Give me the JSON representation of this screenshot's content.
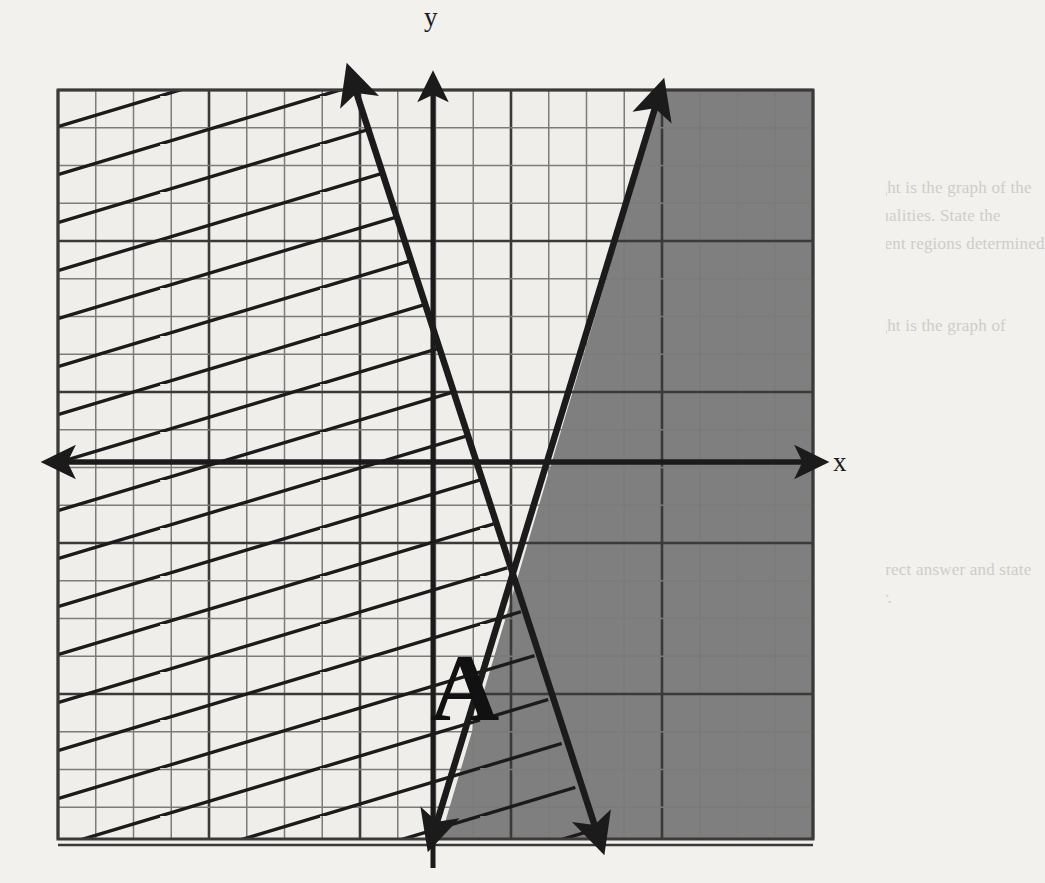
{
  "page": {
    "width": 886,
    "height": 883,
    "background_color": "#f2f1ee",
    "ink_color": "#1b1b1b"
  },
  "bleed_text": {
    "note": "faint mirrored text bleeding through from the reverse side of the scanned page",
    "lines": [
      {
        "text": "e are counted in this part. A correct answer will receive 4 points. Like",
        "x": 12,
        "y": 6,
        "mirrored": false
      },
      {
        "text": "ur the necessary steps, including appropriate formula substitutions,",
        "x": 14,
        "y": 30,
        "mirrored": false
      },
      {
        "text": "ams, graphs, charts, etc. If you show only correct answer with no work",
        "x": 14,
        "y": 54,
        "mirrored": false
      },
      {
        "text": "ve only 1 credit.",
        "x": 14,
        "y": 78,
        "mirrored": false
      },
      {
        "text": "y. [6]",
        "x": 820,
        "y": 130,
        "mirrored": false
      },
      {
        "text": "on the right is the graph of the",
        "x": 820,
        "y": 178,
        "mirrored": false
      },
      {
        "text": "s of inequalities. State the",
        "x": 820,
        "y": 206,
        "mirrored": false
      },
      {
        "text": "the different regions determined",
        "x": 820,
        "y": 234,
        "mirrored": false
      },
      {
        "text": "ph.",
        "x": 820,
        "y": 262,
        "mirrored": false
      },
      {
        "text": "on the right is the graph of",
        "x": 820,
        "y": 316,
        "mirrored": false
      },
      {
        "text": "tions",
        "x": 820,
        "y": 344,
        "mirrored": false
      },
      {
        "text": "le the correct answer and state",
        "x": 820,
        "y": 560,
        "mirrored": false
      },
      {
        "text": "ur answer.",
        "x": 820,
        "y": 588,
        "mirrored": false
      },
      {
        "text": "Gather the right regions pair the point on the graph",
        "x": 10,
        "y": 862,
        "mirrored": false
      }
    ]
  },
  "chart_data": {
    "type": "line",
    "xlabel": "x",
    "ylabel": "y",
    "grid": {
      "visible": true,
      "left_px": 58,
      "top_px": 90,
      "right_px": 813,
      "bottom_px": 839,
      "cell_px": 37.75,
      "columns": 20,
      "rows": 20,
      "minor_color": "#7d7b78",
      "major_color": "#3b3a38",
      "major_every": 4
    },
    "axes": {
      "x_axis": {
        "y_px": 462,
        "x_start_px": 43,
        "x_end_px": 827,
        "arrows": "both",
        "label": "x"
      },
      "y_axis": {
        "x_px": 433,
        "y_start_px": 72,
        "y_end_px": 868,
        "arrows": "up",
        "label": "y"
      }
    },
    "intersection_px": {
      "x": 476,
      "y": 466
    },
    "lines": [
      {
        "name": "rising-boundary-line",
        "description": "steep line through the intersection rising to the upper right; boundary of the solid shaded half plane",
        "slope_sign": "positive",
        "from_px": {
          "x": 428,
          "y": 850
        },
        "to_px": {
          "x": 665,
          "y": 80
        },
        "arrows": "both",
        "stroke_px": 6
      },
      {
        "name": "falling-boundary-line",
        "description": "steep line through the intersection falling to the lower right; boundary of the hatched half plane",
        "slope_sign": "negative",
        "from_px": {
          "x": 347,
          "y": 64
        },
        "to_px": {
          "x": 604,
          "y": 853
        },
        "arrows": "both",
        "stroke_px": 6
      }
    ],
    "regions": [
      {
        "name": "solid-shaded-region",
        "fill": "solid-gray",
        "color": "#7f7f7f",
        "description": "half plane to the right of the rising boundary line, shaded solid gray"
      },
      {
        "name": "hatched-region",
        "fill": "diagonal-hatch",
        "color": "#1b1b1b",
        "hatch_slope": 0.3,
        "hatch_spacing_px": 47,
        "description": "half plane to the left of / above the falling boundary line, filled with parallel diagonal hatch lines rising to the right"
      },
      {
        "name": "region-A",
        "label": "A",
        "description": "overlap region below the intersection between the two boundary lines; both shaded and hatched",
        "label_px": {
          "x": 463,
          "y": 694
        }
      }
    ],
    "labels": [
      {
        "text": "A",
        "x_px": 463,
        "y_px": 694,
        "font_size_px": 96,
        "bold": true,
        "serif": true
      },
      {
        "text": "x",
        "x_px": 843,
        "y_px": 462,
        "font_size_px": 27,
        "bold": false,
        "serif": true
      },
      {
        "text": "y",
        "x_px": 433,
        "y_px": 22,
        "font_size_px": 27,
        "bold": false,
        "serif": true
      }
    ]
  }
}
